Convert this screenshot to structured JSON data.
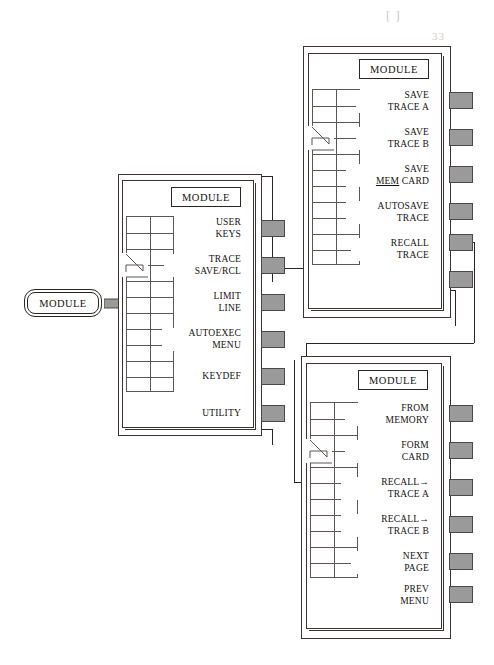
{
  "diagram": {
    "title": "MODULE softkey menu map",
    "colors": {
      "ink": "#15120f",
      "line": "#3a3330",
      "grid": "#5b5653",
      "softkey_pad": "#9a9a9a",
      "ghost_text": "#cfcac4",
      "paper": "#ffffff"
    }
  },
  "hardkey": {
    "label": "MODULE",
    "arrow_icon": "fat-right-arrow"
  },
  "ghost_text": {
    "line1": "[ ]",
    "line2": "33",
    "line3": "[ ]"
  },
  "panels": [
    {
      "id": "module-main",
      "title": "MODULE",
      "softkeys": [
        {
          "lines": [
            "USER",
            "KEYS"
          ]
        },
        {
          "lines": [
            "TRACE",
            "SAVE/RCL"
          ]
        },
        {
          "lines": [
            "LIMIT",
            "LINE"
          ]
        },
        {
          "lines": [
            "AUTOEXEC",
            "MENU"
          ]
        },
        {
          "lines": [
            "KEYDEF"
          ]
        },
        {
          "lines": [
            "UTILITY"
          ]
        }
      ],
      "pad_count": 6,
      "grid": {
        "cols": 2,
        "rows": 11
      }
    },
    {
      "id": "trace-save-rcl",
      "title": "MODULE",
      "softkeys": [
        {
          "lines": [
            "SAVE",
            "TRACE A"
          ]
        },
        {
          "lines": [
            "SAVE",
            "TRACE B"
          ]
        },
        {
          "lines": [
            "SAVE",
            "MEM CARD"
          ],
          "underline": "MEM"
        },
        {
          "lines": [
            "AUTOSAVE",
            "TRACE"
          ]
        },
        {
          "lines": [
            "RECALL",
            "TRACE"
          ]
        }
      ],
      "pad_count": 6,
      "grid": {
        "cols": 2,
        "rows": 11
      }
    },
    {
      "id": "recall-trace",
      "title": "MODULE",
      "softkeys": [
        {
          "lines": [
            "FROM",
            "MEMORY"
          ]
        },
        {
          "lines": [
            "FORM",
            "CARD"
          ]
        },
        {
          "lines": [
            "RECALL→",
            "TRACE A"
          ]
        },
        {
          "lines": [
            "RECALL→",
            "TRACE B"
          ]
        },
        {
          "lines": [
            "NEXT",
            "PAGE"
          ]
        },
        {
          "lines": [
            "PREV",
            "MENU"
          ]
        }
      ],
      "pad_count": 6,
      "grid": {
        "cols": 2,
        "rows": 11
      }
    }
  ]
}
